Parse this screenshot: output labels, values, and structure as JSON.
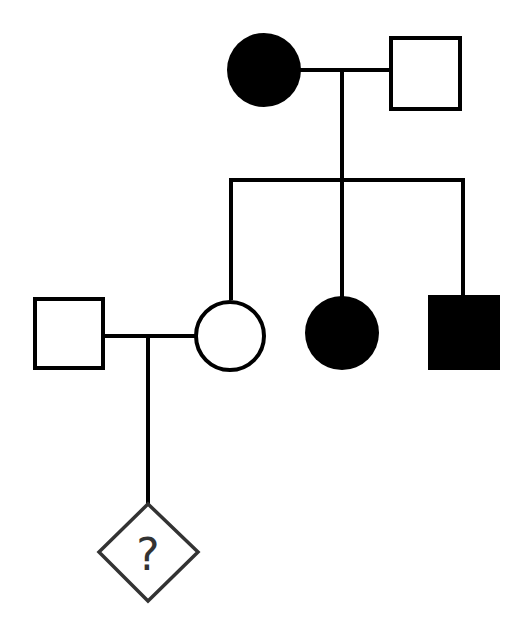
{
  "diagram": {
    "type": "pedigree",
    "colors": {
      "line": "#000000",
      "affected_fill": "#000000",
      "unaffected_fill": "#ffffff",
      "unknown_stroke": "#333333"
    },
    "generations": [
      {
        "level": 1,
        "individuals": [
          {
            "id": "I-1",
            "sex": "female",
            "shape": "circle",
            "affected": true
          },
          {
            "id": "I-2",
            "sex": "male",
            "shape": "square",
            "affected": false
          }
        ]
      },
      {
        "level": 2,
        "individuals": [
          {
            "id": "II-1",
            "sex": "male",
            "shape": "square",
            "affected": false,
            "note": "spouse (married in)"
          },
          {
            "id": "II-2",
            "sex": "female",
            "shape": "circle",
            "affected": false
          },
          {
            "id": "II-3",
            "sex": "female",
            "shape": "circle",
            "affected": true
          },
          {
            "id": "II-4",
            "sex": "male",
            "shape": "square",
            "affected": true
          }
        ]
      },
      {
        "level": 3,
        "individuals": [
          {
            "id": "III-1",
            "sex": "unknown",
            "shape": "diamond",
            "affected": "unknown",
            "label": "?"
          }
        ]
      }
    ],
    "unknown_label": "?"
  }
}
